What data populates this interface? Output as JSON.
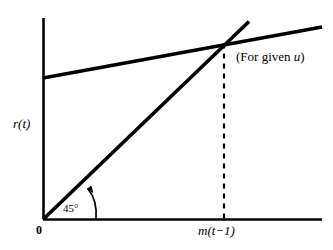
{
  "figure": {
    "width": 333,
    "height": 250,
    "background_color": "#ffffff",
    "ink_color": "#000000"
  },
  "labels": {
    "y_axis": "r(t)",
    "origin": "0",
    "angle": "45°",
    "x_tick": "m(t−1)",
    "annotation": "(For given u)"
  },
  "chart_data": {
    "type": "line",
    "title": "",
    "subtitle": "",
    "xlabel": "",
    "ylabel": "r(t)",
    "grid": false,
    "legend": "none",
    "annotations": [
      {
        "name": "for-given-u",
        "text": "(For given u)",
        "x": 0.69,
        "y": 0.87,
        "note": "labels the flatter revenue curve drawn for a fixed value of u"
      },
      {
        "name": "forty-five-degree",
        "text": "45°",
        "x": 0.07,
        "y": 0.08,
        "note": "curved arrow pointing at the 45-degree reference line near the origin"
      }
    ],
    "axes": {
      "x": {
        "min": 0,
        "max": 1.39,
        "origin_label": "0",
        "ticks": [
          {
            "value": 0.9,
            "label": "m(t−1)"
          }
        ],
        "arrow": false
      },
      "y": {
        "min": 0,
        "max": 1.0,
        "origin_label": "0",
        "ticks": [],
        "arrow": false
      }
    },
    "series": [
      {
        "name": "forty-five-degree-line",
        "type": "line",
        "style": "solid",
        "linewidth": 3,
        "color": "#000000",
        "points": [
          {
            "x": 0.0,
            "y": 0.0
          },
          {
            "x": 1.025,
            "y": 0.98
          }
        ],
        "note": "45 degree reference line r(t) = m(t-1), slope 1 through the origin"
      },
      {
        "name": "revenue-curve-given-u",
        "type": "line",
        "style": "solid",
        "linewidth": 3,
        "color": "#000000",
        "points": [
          {
            "x": 0.0,
            "y": 0.702
          },
          {
            "x": 1.39,
            "y": 0.955
          }
        ],
        "note": "shallow upward sloping schedule drawn for a given u; positive intercept"
      },
      {
        "name": "equilibrium-dropline",
        "type": "line",
        "style": "dashed",
        "linewidth": 2,
        "color": "#000000",
        "points": [
          {
            "x": 0.9,
            "y": 0.87
          },
          {
            "x": 0.9,
            "y": 0.0
          }
        ],
        "note": "vertical dashed line from the intersection down to the x-axis at m(t-1)"
      }
    ],
    "intersections": [
      {
        "name": "steady-state",
        "x": 0.9,
        "y": 0.87,
        "x_label": "m(t−1)",
        "series": [
          "forty-five-degree-line",
          "revenue-curve-given-u"
        ]
      }
    ]
  }
}
